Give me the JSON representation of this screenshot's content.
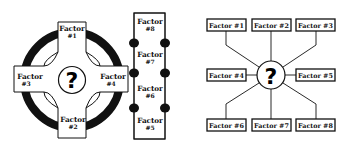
{
  "diagrams": {
    "cross": {
      "center_symbol": "?",
      "arms": [
        {
          "position": "top",
          "word": "Factor",
          "num": "#1"
        },
        {
          "position": "bottom",
          "word": "Factor",
          "num": "#2"
        },
        {
          "position": "left",
          "word": "Factor",
          "num": "#3"
        },
        {
          "position": "right",
          "word": "Factor",
          "num": "#4"
        }
      ]
    },
    "column": {
      "segments": [
        {
          "word": "Factor",
          "num": "#8"
        },
        {
          "word": "Factor",
          "num": "#7"
        },
        {
          "word": "Factor",
          "num": "#6"
        },
        {
          "word": "Factor",
          "num": "#5"
        }
      ]
    },
    "hub": {
      "center_symbol": "?",
      "boxes": [
        {
          "label": "Factor #1"
        },
        {
          "label": "Factor #2"
        },
        {
          "label": "Factor #3"
        },
        {
          "label": "Factor #4"
        },
        {
          "label": "Factor #5"
        },
        {
          "label": "Factor #6"
        },
        {
          "label": "Factor #7"
        },
        {
          "label": "Factor #8"
        }
      ]
    }
  },
  "colors": {
    "ink": "#111111",
    "background": "#ffffff"
  }
}
